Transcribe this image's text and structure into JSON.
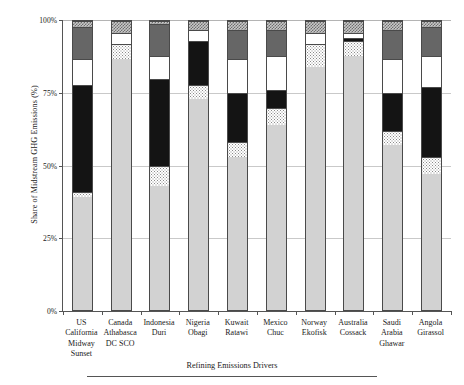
{
  "chart_data": {
    "type": "bar",
    "subtype": "stacked-bar-100-percent",
    "title": "",
    "caption": "Refining Emissions Drivers",
    "xlabel": "",
    "ylabel": "Share of Midstream GHG Emissions (%)",
    "ylim": [
      0,
      100
    ],
    "yticks": [
      0,
      25,
      50,
      75,
      100
    ],
    "ytick_labels": [
      "0%",
      "25%",
      "50%",
      "75%",
      "100%"
    ],
    "grid": true,
    "legend": "none",
    "stack_order": "bottom-to-top",
    "categories": [
      "US California Midway Sunset",
      "Canada Athabasca DC SCO",
      "Indonesia Duri",
      "Nigeria Obagi",
      "Kuwait Ratawi",
      "Mexico Chuc",
      "Norway Ekofisk",
      "Australia Cossack",
      "Saudi Arabia Ghawar",
      "Angola Girassol"
    ],
    "category_lines": [
      [
        "US",
        "California",
        "Midway",
        "Sunset"
      ],
      [
        "Canada",
        "Athabasca",
        "DC SCO"
      ],
      [
        "Indonesia",
        "Duri"
      ],
      [
        "Nigeria",
        "Obagi"
      ],
      [
        "Kuwait",
        "Ratawi"
      ],
      [
        "Mexico",
        "Chuc"
      ],
      [
        "Norway",
        "Ekofisk"
      ],
      [
        "Australia",
        "Cossack"
      ],
      [
        "Saudi",
        "Arabia",
        "Ghawar"
      ],
      [
        "Angola",
        "Girassol"
      ]
    ],
    "series": [
      {
        "name": "Series 1",
        "pattern": "light-gray",
        "color": "#d2d2d2",
        "values": [
          39,
          87,
          43,
          73,
          53,
          64,
          84,
          88,
          57,
          47
        ]
      },
      {
        "name": "Series 2",
        "pattern": "dotted",
        "color": "#ffffff",
        "values": [
          2,
          5,
          7,
          5,
          5,
          6,
          8,
          5,
          5,
          6
        ]
      },
      {
        "name": "Series 3",
        "pattern": "black",
        "color": "#141414",
        "values": [
          37,
          0,
          30,
          15,
          17,
          6,
          0,
          1,
          13,
          24
        ]
      },
      {
        "name": "Series 4",
        "pattern": "white",
        "color": "#ffffff",
        "values": [
          9,
          4,
          8,
          4,
          12,
          12,
          4,
          2,
          12,
          11
        ]
      },
      {
        "name": "Series 5",
        "pattern": "dark-gray",
        "color": "#666666",
        "values": [
          11,
          0,
          11,
          0,
          10,
          9,
          0,
          0,
          10,
          10
        ]
      },
      {
        "name": "Series 6",
        "pattern": "checker",
        "color": "#c8c8c8",
        "values": [
          2,
          4,
          1,
          3,
          3,
          3,
          4,
          4,
          3,
          2
        ]
      }
    ]
  },
  "axis": {
    "y_title": "Share of Midstream GHG Emissions (%)"
  },
  "footer": {
    "caption": "Refining Emissions Drivers"
  }
}
